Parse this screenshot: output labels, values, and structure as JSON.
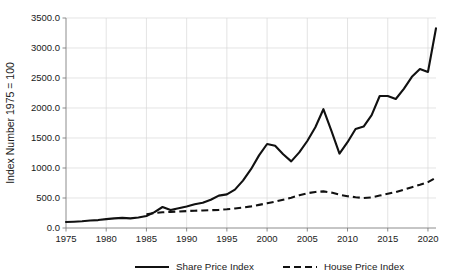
{
  "chart_data": {
    "type": "line",
    "title": "",
    "xlabel": "",
    "ylabel": "Index Number 1975 = 100",
    "xlim": [
      1975,
      2021
    ],
    "ylim": [
      0,
      3500
    ],
    "grid": true,
    "legend_position": "bottom",
    "x_tick_labels": [
      "1975",
      "1980",
      "1985",
      "1990",
      "1995",
      "2000",
      "2005",
      "2010",
      "2015",
      "2020"
    ],
    "x_ticks": [
      1975,
      1980,
      1985,
      1990,
      1995,
      2000,
      2005,
      2010,
      2015,
      2020
    ],
    "y_tick_labels": [
      "0.0",
      "500.0",
      "1000.0",
      "1500.0",
      "2000.0",
      "2500.0",
      "3000.0",
      "3500.0"
    ],
    "y_ticks": [
      0,
      500,
      1000,
      1500,
      2000,
      2500,
      3000,
      3500
    ],
    "series": [
      {
        "name": "Share Price Index",
        "style": "solid",
        "color": "#111111",
        "x": [
          1975,
          1976,
          1977,
          1978,
          1979,
          1980,
          1981,
          1982,
          1983,
          1984,
          1985,
          1986,
          1987,
          1988,
          1989,
          1990,
          1991,
          1992,
          1993,
          1994,
          1995,
          1996,
          1997,
          1998,
          1999,
          2000,
          2001,
          2002,
          2003,
          2004,
          2005,
          2006,
          2007,
          2008,
          2009,
          2010,
          2011,
          2012,
          2013,
          2014,
          2015,
          2016,
          2017,
          2018,
          2019,
          2020,
          2021
        ],
        "values": [
          100,
          105,
          112,
          125,
          132,
          148,
          160,
          168,
          160,
          175,
          200,
          265,
          350,
          300,
          330,
          360,
          395,
          420,
          470,
          540,
          560,
          640,
          790,
          980,
          1210,
          1400,
          1370,
          1230,
          1110,
          1260,
          1450,
          1680,
          1980,
          1620,
          1240,
          1430,
          1650,
          1690,
          1880,
          2200,
          2200,
          2150,
          2320,
          2520,
          2650,
          2600,
          3330
        ]
      },
      {
        "name": "House Price Index",
        "style": "dashed",
        "color": "#111111",
        "x": [
          1985,
          1986,
          1987,
          1988,
          1989,
          1990,
          1991,
          1992,
          1993,
          1994,
          1995,
          1996,
          1997,
          1998,
          1999,
          2000,
          2001,
          2002,
          2003,
          2004,
          2005,
          2006,
          2007,
          2008,
          2009,
          2010,
          2011,
          2012,
          2013,
          2014,
          2015,
          2016,
          2017,
          2018,
          2019,
          2020,
          2021
        ],
        "values": [
          230,
          250,
          262,
          268,
          275,
          282,
          288,
          292,
          296,
          302,
          312,
          325,
          340,
          360,
          385,
          412,
          440,
          472,
          505,
          545,
          580,
          600,
          610,
          590,
          555,
          530,
          512,
          500,
          510,
          540,
          570,
          600,
          640,
          680,
          720,
          765,
          840
        ]
      }
    ]
  },
  "legend": {
    "items": [
      {
        "label": "Share Price Index",
        "style": "solid"
      },
      {
        "label": "House Price Index",
        "style": "dashed"
      }
    ]
  }
}
